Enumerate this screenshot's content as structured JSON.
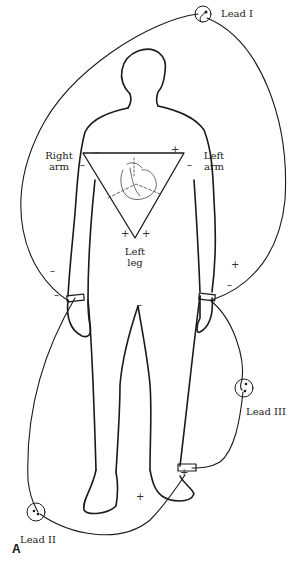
{
  "diagram": {
    "figure_label": "A",
    "leads": [
      {
        "name": "Lead I"
      },
      {
        "name": "Lead II"
      },
      {
        "name": "Lead III"
      }
    ],
    "limb_labels": {
      "right_arm": [
        "Right",
        "arm"
      ],
      "left_arm": [
        "Left",
        "arm"
      ],
      "left_leg": [
        "Left",
        "leg"
      ]
    },
    "signs": {
      "plus": "+",
      "minus": "–"
    },
    "colors": {
      "line": "#1a1a1a",
      "background": "#ffffff"
    }
  }
}
